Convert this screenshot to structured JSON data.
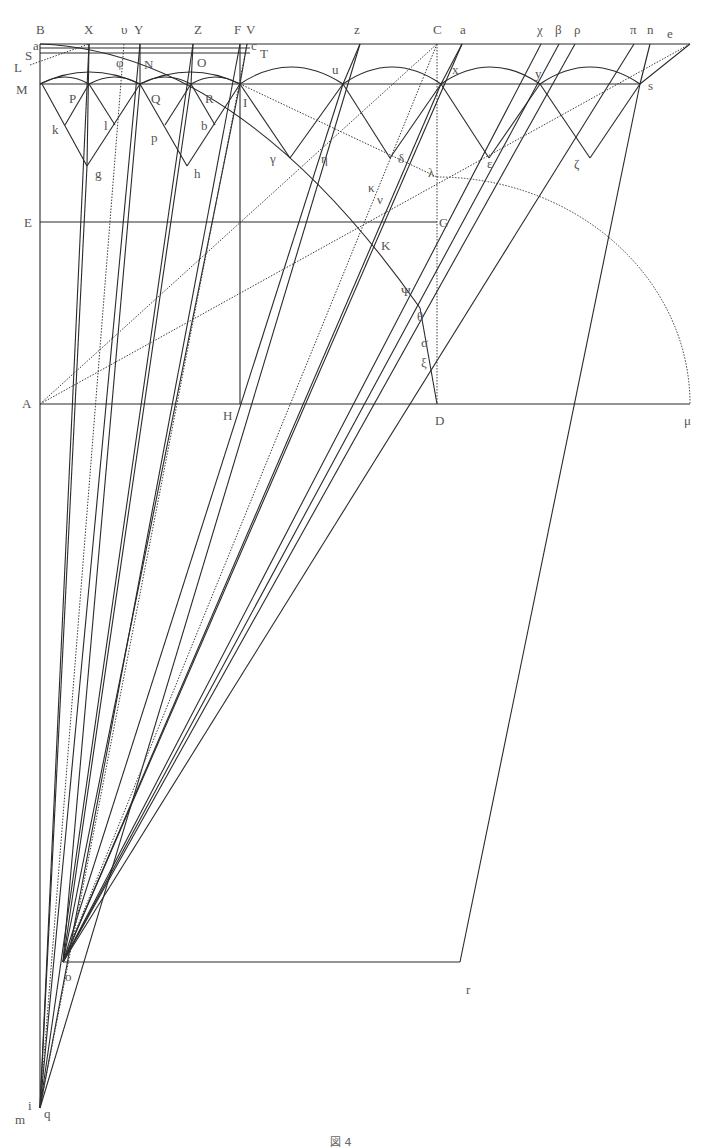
{
  "figure": {
    "caption": "図 4",
    "stroke_color": "#2a2a2a",
    "label_color": "#555555"
  },
  "points": {
    "B": [
      40,
      44
    ],
    "a": [
      40,
      48
    ],
    "S": [
      40,
      53
    ],
    "L": [
      30,
      65
    ],
    "X": [
      89,
      44
    ],
    "upsilon": [
      124,
      44
    ],
    "Y": [
      140,
      44
    ],
    "Z": [
      193,
      44
    ],
    "F": [
      240,
      44
    ],
    "V": [
      247,
      44
    ],
    "c": [
      247,
      48
    ],
    "T": [
      255,
      55
    ],
    "z": [
      360,
      44
    ],
    "C": [
      437,
      44
    ],
    "alpha": [
      462,
      44
    ],
    "chi": [
      541,
      44
    ],
    "beta": [
      559,
      44
    ],
    "rho": [
      575,
      44
    ],
    "pi": [
      634,
      44
    ],
    "n": [
      650,
      44
    ],
    "e": [
      690,
      44
    ],
    "M": [
      40,
      84
    ],
    "P": [
      89,
      84
    ],
    "N": [
      140,
      84
    ],
    "Q": [
      191,
      84
    ],
    "R": [
      240,
      84
    ],
    "I": [
      240,
      84
    ],
    "u": [
      343,
      84
    ],
    "x": [
      441,
      84
    ],
    "y": [
      540,
      84
    ],
    "s": [
      640,
      84
    ],
    "k": [
      65,
      125
    ],
    "l": [
      115,
      125
    ],
    "p": [
      165,
      125
    ],
    "b": [
      215,
      125
    ],
    "g": [
      87,
      166
    ],
    "h": [
      187,
      166
    ],
    "gamma": [
      290,
      158
    ],
    "delta": [
      390,
      158
    ],
    "epsilon": [
      489,
      158
    ],
    "zeta": [
      590,
      158
    ],
    "eta": [
      322,
      148
    ],
    "lambda": [
      437,
      177
    ],
    "kappa": [
      372,
      195
    ],
    "nu": [
      381,
      205
    ],
    "E": [
      40,
      222
    ],
    "G": [
      437,
      222
    ],
    "K": [
      383,
      222
    ],
    "Psi": [
      417,
      290
    ],
    "theta": [
      420,
      308
    ],
    "sigma": [
      428,
      345
    ],
    "xi": [
      432,
      372
    ],
    "A": [
      40,
      404
    ],
    "H": [
      240,
      404
    ],
    "D": [
      437,
      404
    ],
    "mu": [
      690,
      404
    ],
    "o": [
      63,
      962
    ],
    "r": [
      460,
      962
    ],
    "m": [
      40,
      1108
    ],
    "q": [
      40,
      1108
    ],
    "i": [
      40,
      1108
    ]
  },
  "labels": [
    {
      "t": "B",
      "x": 36,
      "y": 34
    },
    {
      "t": "X",
      "x": 84,
      "y": 34
    },
    {
      "t": "υ",
      "x": 121,
      "y": 34
    },
    {
      "t": "Y",
      "x": 134,
      "y": 34
    },
    {
      "t": "Z",
      "x": 194,
      "y": 34
    },
    {
      "t": "F",
      "x": 234,
      "y": 34
    },
    {
      "t": "V",
      "x": 246,
      "y": 34
    },
    {
      "t": "z",
      "x": 354,
      "y": 34
    },
    {
      "t": "C",
      "x": 433,
      "y": 34
    },
    {
      "t": "a",
      "x": 460,
      "y": 34
    },
    {
      "t": "χ",
      "x": 537,
      "y": 34
    },
    {
      "t": "β",
      "x": 555,
      "y": 34
    },
    {
      "t": "ρ",
      "x": 574,
      "y": 34
    },
    {
      "t": "π",
      "x": 630,
      "y": 34
    },
    {
      "t": "n",
      "x": 647,
      "y": 34
    },
    {
      "t": "e",
      "x": 667,
      "y": 38
    },
    {
      "t": "a",
      "x": 33,
      "y": 50
    },
    {
      "t": "S",
      "x": 25,
      "y": 60
    },
    {
      "t": "L",
      "x": 14,
      "y": 72
    },
    {
      "t": "c",
      "x": 251,
      "y": 50
    },
    {
      "t": "T",
      "x": 260,
      "y": 58
    },
    {
      "t": "φ",
      "x": 116,
      "y": 67
    },
    {
      "t": "N",
      "x": 144,
      "y": 69
    },
    {
      "t": "O",
      "x": 197,
      "y": 67
    },
    {
      "t": "M",
      "x": 16,
      "y": 94
    },
    {
      "t": "P",
      "x": 69,
      "y": 103
    },
    {
      "t": "Q",
      "x": 151,
      "y": 103
    },
    {
      "t": "R",
      "x": 205,
      "y": 103
    },
    {
      "t": "I",
      "x": 243,
      "y": 107
    },
    {
      "t": "u",
      "x": 332,
      "y": 74
    },
    {
      "t": "x",
      "x": 452,
      "y": 74
    },
    {
      "t": "y",
      "x": 535,
      "y": 78
    },
    {
      "t": "s",
      "x": 648,
      "y": 90
    },
    {
      "t": "k",
      "x": 52,
      "y": 134
    },
    {
      "t": "l",
      "x": 104,
      "y": 130
    },
    {
      "t": "p",
      "x": 151,
      "y": 142
    },
    {
      "t": "b",
      "x": 201,
      "y": 130
    },
    {
      "t": "g",
      "x": 95,
      "y": 178
    },
    {
      "t": "h",
      "x": 194,
      "y": 178
    },
    {
      "t": "γ",
      "x": 270,
      "y": 163
    },
    {
      "t": "η",
      "x": 321,
      "y": 163
    },
    {
      "t": "δ",
      "x": 398,
      "y": 163
    },
    {
      "t": "ε",
      "x": 487,
      "y": 168
    },
    {
      "t": "ζ",
      "x": 574,
      "y": 168
    },
    {
      "t": "λ",
      "x": 428,
      "y": 177
    },
    {
      "t": "κ",
      "x": 368,
      "y": 192
    },
    {
      "t": "ν",
      "x": 377,
      "y": 204
    },
    {
      "t": "E",
      "x": 24,
      "y": 227
    },
    {
      "t": "G",
      "x": 439,
      "y": 227
    },
    {
      "t": "K",
      "x": 381,
      "y": 250
    },
    {
      "t": "Ψ",
      "x": 401,
      "y": 296
    },
    {
      "t": "θ",
      "x": 417,
      "y": 321
    },
    {
      "t": "σ",
      "x": 421,
      "y": 347
    },
    {
      "t": "ξ",
      "x": 421,
      "y": 367
    },
    {
      "t": "A",
      "x": 22,
      "y": 408
    },
    {
      "t": "H",
      "x": 223,
      "y": 420
    },
    {
      "t": "D",
      "x": 435,
      "y": 425
    },
    {
      "t": "μ",
      "x": 684,
      "y": 425
    },
    {
      "t": "o",
      "x": 65,
      "y": 981
    },
    {
      "t": "r",
      "x": 466,
      "y": 994
    },
    {
      "t": "i",
      "x": 28,
      "y": 1110
    },
    {
      "t": "q",
      "x": 44,
      "y": 1118
    },
    {
      "t": "m",
      "x": 15,
      "y": 1124
    }
  ],
  "solid_lines": [
    [
      40,
      44,
      690,
      44
    ],
    [
      40,
      48,
      250,
      48
    ],
    [
      40,
      53,
      250,
      53
    ],
    [
      40,
      84,
      640,
      84
    ],
    [
      40,
      44,
      40,
      1108
    ],
    [
      40,
      222,
      437,
      222
    ],
    [
      40,
      404,
      690,
      404
    ],
    [
      240,
      44,
      240,
      404
    ],
    [
      63,
      962,
      460,
      962
    ],
    [
      42,
      84,
      87,
      166
    ],
    [
      87,
      166,
      140,
      84
    ],
    [
      89,
      84,
      65,
      125
    ],
    [
      89,
      84,
      115,
      125
    ],
    [
      140,
      84,
      187,
      166
    ],
    [
      187,
      166,
      240,
      84
    ],
    [
      191,
      84,
      165,
      125
    ],
    [
      191,
      84,
      215,
      125
    ],
    [
      240,
      84,
      290,
      158
    ],
    [
      290,
      158,
      343,
      84
    ],
    [
      343,
      84,
      390,
      158
    ],
    [
      390,
      158,
      441,
      84
    ],
    [
      441,
      84,
      489,
      158
    ],
    [
      489,
      158,
      540,
      84
    ],
    [
      540,
      84,
      590,
      158
    ],
    [
      590,
      158,
      640,
      84
    ],
    [
      89,
      44,
      87,
      166
    ],
    [
      140,
      44,
      140,
      84
    ],
    [
      193,
      44,
      191,
      84
    ],
    [
      247,
      44,
      240,
      84
    ],
    [
      360,
      44,
      343,
      84
    ],
    [
      462,
      44,
      441,
      84
    ],
    [
      690,
      44,
      640,
      84
    ],
    [
      650,
      44,
      640,
      84
    ],
    [
      87,
      166,
      40,
      1108
    ],
    [
      89,
      44,
      40,
      1108
    ],
    [
      140,
      84,
      63,
      962
    ],
    [
      191,
      84,
      63,
      962
    ],
    [
      240,
      84,
      63,
      962
    ],
    [
      343,
      84,
      63,
      962
    ],
    [
      441,
      84,
      63,
      962
    ],
    [
      541,
      44,
      63,
      962
    ],
    [
      559,
      44,
      63,
      962
    ],
    [
      575,
      44,
      63,
      962
    ],
    [
      634,
      44,
      63,
      962
    ],
    [
      640,
      84,
      460,
      962
    ],
    [
      360,
      44,
      40,
      1108
    ],
    [
      462,
      44,
      63,
      962
    ],
    [
      240,
      44,
      40,
      1108
    ],
    [
      193,
      44,
      40,
      1108
    ],
    [
      140,
      44,
      40,
      1108
    ],
    [
      420,
      308,
      437,
      404
    ]
  ],
  "dotted_lines": [
    [
      30,
      65,
      89,
      44
    ],
    [
      437,
      44,
      437,
      404
    ],
    [
      40,
      404,
      437,
      44
    ],
    [
      40,
      404,
      690,
      44
    ],
    [
      124,
      44,
      40,
      1108
    ],
    [
      247,
      44,
      40,
      1108
    ],
    [
      437,
      44,
      63,
      962
    ],
    [
      240,
      84,
      437,
      177
    ]
  ],
  "arcs": [
    "M40,84 Q89,60 140,84",
    "M40,84 Q65,70 89,84",
    "M89,84 Q115,70 140,84",
    "M140,84 Q191,60 240,84",
    "M140,84 Q165,70 191,84",
    "M191,84 Q215,70 240,84",
    "M240,84 Q291,50 343,84",
    "M343,84 Q392,50 441,84",
    "M441,84 Q490,50 540,84",
    "M540,84 Q590,50 640,84",
    "M40,44 Q240,52 420,308"
  ],
  "dotted_arcs": [
    "M437,177 A253,227 0 0 1 690,404"
  ]
}
